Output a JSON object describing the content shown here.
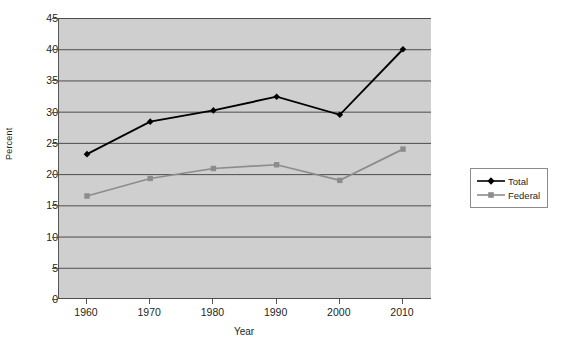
{
  "chart_data": {
    "type": "line",
    "title": "",
    "xlabel": "Year",
    "ylabel": "Percent",
    "categories": [
      1960,
      1970,
      1980,
      1990,
      2000,
      2010
    ],
    "xtick_labels": [
      "1960",
      "1970",
      "1980",
      "1990",
      "2000",
      "2010"
    ],
    "ytick_labels": [
      "0",
      "5",
      "10",
      "15",
      "20",
      "25",
      "30",
      "35",
      "40",
      "45"
    ],
    "yticks": [
      0,
      5,
      10,
      15,
      20,
      25,
      30,
      35,
      40,
      45
    ],
    "ylim": [
      0,
      45
    ],
    "xlim": [
      1955,
      2015
    ],
    "grid": "horizontal",
    "legend_position": "right",
    "plot_background": "#cfcfcf",
    "series": [
      {
        "name": "Total",
        "color": "#000000",
        "marker": "diamond",
        "values": [
          23.2,
          28.4,
          30.2,
          32.4,
          29.5,
          40.0
        ]
      },
      {
        "name": "Federal",
        "color": "#8c8c8c",
        "marker": "square",
        "values": [
          16.5,
          19.3,
          20.9,
          21.5,
          19.0,
          24.0
        ]
      }
    ]
  },
  "legend": {
    "items": [
      {
        "label": "Total"
      },
      {
        "label": "Federal"
      }
    ]
  },
  "axes": {
    "y_title": "Percent",
    "x_title": "Year"
  }
}
